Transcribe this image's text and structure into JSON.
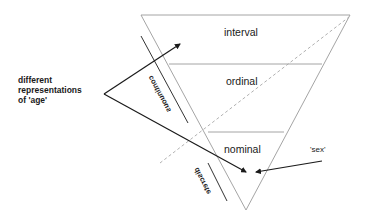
{
  "diagram": {
    "levels": [
      "interval",
      "ordinal",
      "nominal"
    ],
    "side_labels": {
      "continuous": "continuous",
      "discrete": "discrete"
    },
    "annotations": {
      "age_line1": "different",
      "age_line2": "representations",
      "age_line3": "of 'age'",
      "sex": "'sex'"
    },
    "colors": {
      "triangle": "#9a9a9a",
      "arrows": "#1a1a1a",
      "dashed": "#a0a0a0",
      "text": "#1a1a1a"
    }
  }
}
